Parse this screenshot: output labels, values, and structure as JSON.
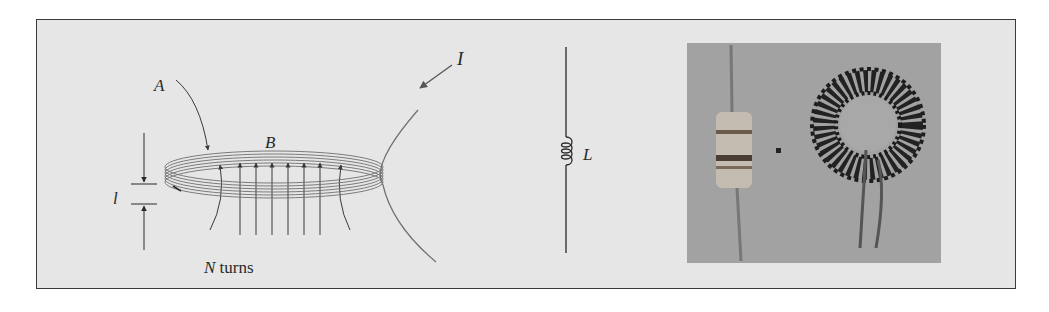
{
  "figure": {
    "panels": [
      {
        "id": "coil",
        "labels": {
          "area": "A",
          "field": "B",
          "current": "I",
          "length": "l",
          "turns_var": "N",
          "turns_word": " turns"
        }
      },
      {
        "id": "symbol",
        "labels": {
          "inductance": "L"
        }
      },
      {
        "id": "photo",
        "description": "Photograph of an axial-lead inductor and a toroidal inductor"
      }
    ],
    "colors": {
      "panel_bg": "#e6e6e6",
      "border": "#3a3a3a",
      "wire": "#6e6e6e",
      "ink": "#2a2a2a",
      "photo_bg": "#9a9a9a"
    }
  }
}
